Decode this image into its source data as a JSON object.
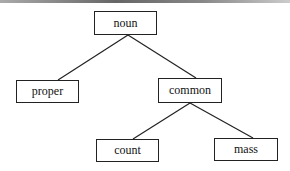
{
  "diagram": {
    "type": "tree",
    "nodes": {
      "noun": "noun",
      "proper": "proper",
      "common": "common",
      "count": "count",
      "mass": "mass"
    },
    "edges": [
      [
        "noun",
        "proper"
      ],
      [
        "noun",
        "common"
      ],
      [
        "common",
        "count"
      ],
      [
        "common",
        "mass"
      ]
    ],
    "colors": {
      "line": "#222222",
      "background": "#ffffff"
    }
  }
}
